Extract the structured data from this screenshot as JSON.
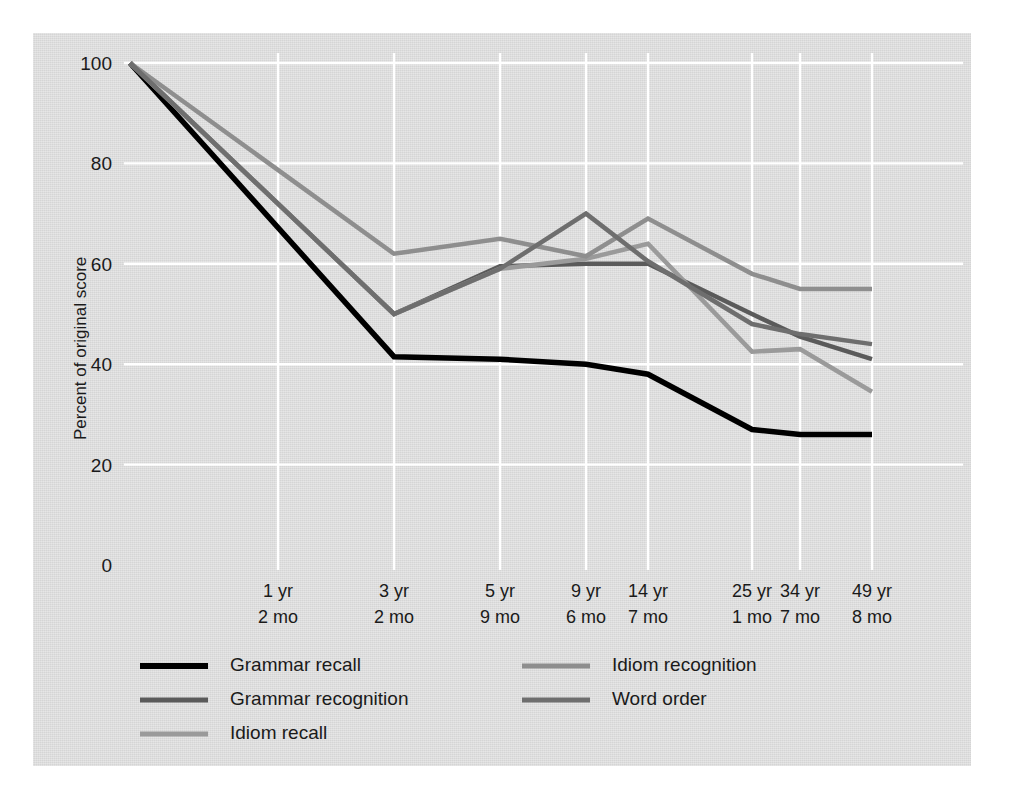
{
  "figure": {
    "panel_color": "#dcdcdc",
    "background_color": "#ffffff",
    "gridline_color": "#ffffff"
  },
  "chart_data": {
    "type": "line",
    "title": "",
    "subtitle": "",
    "xlabel": "",
    "ylabel": "Percent of original score",
    "ylim": [
      0,
      100
    ],
    "yticks": [
      0,
      20,
      40,
      60,
      80,
      100
    ],
    "ytick_labels": [
      "0",
      "20",
      "40",
      "60",
      "80",
      "100"
    ],
    "grid": true,
    "legend_position": "bottom",
    "categories": [
      "start",
      "1 yr\n2 mo",
      "3 yr\n2 mo",
      "5 yr\n9 mo",
      "9 yr\n6 mo",
      "14 yr\n7 mo",
      "25 yr\n1 mo",
      "34 yr\n7 mo",
      "49 yr\n8 mo"
    ],
    "xtick_labels": [
      {
        "line1": "1 yr",
        "line2": "2 mo"
      },
      {
        "line1": "3 yr",
        "line2": "2 mo"
      },
      {
        "line1": "5 yr",
        "line2": "9 mo"
      },
      {
        "line1": "9 yr",
        "line2": "6 mo"
      },
      {
        "line1": "14 yr",
        "line2": "7 mo"
      },
      {
        "line1": "25 yr",
        "line2": "1 mo"
      },
      {
        "line1": "34 yr",
        "line2": "7 mo"
      },
      {
        "line1": "49 yr",
        "line2": "8 mo"
      }
    ],
    "x_positions": [
      130,
      278,
      394,
      500,
      586,
      648,
      752,
      800,
      872
    ],
    "series": [
      {
        "name": "Grammar recall",
        "color": "#000000",
        "width": 5.5,
        "values": [
          100,
          null,
          41.5,
          41,
          40,
          38,
          27,
          26,
          26
        ]
      },
      {
        "name": "Grammar recognition",
        "color": "#5a5a5a",
        "width": 4.5,
        "values": [
          100,
          null,
          50,
          59.5,
          60,
          60,
          50,
          45.5,
          41
        ]
      },
      {
        "name": "Idiom recall",
        "color": "#9a9a9a",
        "width": 4.5,
        "values": [
          100,
          null,
          50,
          59,
          61,
          64,
          42.5,
          43,
          34.5
        ]
      },
      {
        "name": "Idiom recognition",
        "color": "#8e8e8e",
        "width": 4.5,
        "values": [
          100,
          null,
          62,
          65,
          61.5,
          69,
          58,
          55,
          55
        ]
      },
      {
        "name": "Word order",
        "color": "#6e6e6e",
        "width": 4.5,
        "values": [
          100,
          null,
          50,
          59,
          70,
          60.5,
          48,
          46,
          44
        ]
      }
    ]
  },
  "legend": {
    "entries": [
      {
        "label": "Grammar recall",
        "color": "#000000",
        "column": 0,
        "row": 0
      },
      {
        "label": "Grammar recognition",
        "color": "#5a5a5a",
        "column": 0,
        "row": 1
      },
      {
        "label": "Idiom recall",
        "color": "#9a9a9a",
        "column": 0,
        "row": 2
      },
      {
        "label": "Idiom recognition",
        "color": "#8e8e8e",
        "column": 1,
        "row": 0
      },
      {
        "label": "Word order",
        "color": "#6e6e6e",
        "column": 1,
        "row": 1
      }
    ]
  }
}
